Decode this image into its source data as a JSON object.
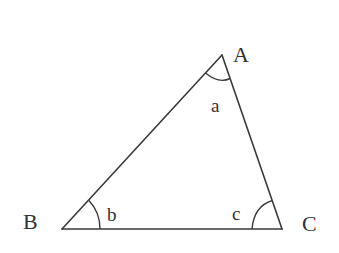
{
  "diagram": {
    "type": "triangle",
    "vertices": {
      "A": {
        "label": "A",
        "x": 222,
        "y": 55
      },
      "B": {
        "label": "B",
        "x": 62,
        "y": 229
      },
      "C": {
        "label": "C",
        "x": 282,
        "y": 229
      }
    },
    "angles": {
      "a": {
        "label": "a",
        "vertex": "A"
      },
      "b": {
        "label": "b",
        "vertex": "B"
      },
      "c": {
        "label": "c",
        "vertex": "C"
      }
    },
    "colors": {
      "stroke": "#3a3a3a",
      "text": "#333333",
      "background": "#ffffff"
    }
  }
}
